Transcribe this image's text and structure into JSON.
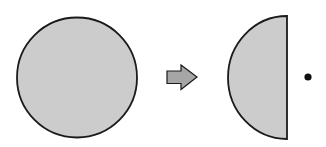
{
  "diagram": {
    "colors": {
      "background": "#ffffff",
      "shape_fill": "#cccccc",
      "arrow_fill": "#a6a6a6",
      "outline": "#1a1a1a",
      "dot": "#111111"
    },
    "elements": [
      {
        "id": "full-circle",
        "type": "circle",
        "cx": 77,
        "cy": 77.5,
        "r": 60
      },
      {
        "id": "transform-arrow",
        "type": "block-arrow",
        "direction": "right",
        "x_start": 167,
        "x_end": 197,
        "cy": 77
      },
      {
        "id": "half-disc",
        "type": "half-ellipse",
        "flat_edge_x": 287,
        "cy": 77.5,
        "rx": 59,
        "ry": 61.5,
        "side": "left"
      },
      {
        "id": "point",
        "type": "dot",
        "cx": 308,
        "cy": 77,
        "r": 3.5
      }
    ]
  }
}
